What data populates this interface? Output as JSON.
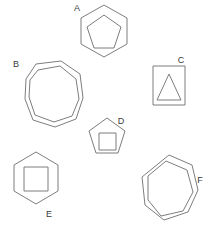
{
  "canvas": {
    "width": 212,
    "height": 232,
    "background": "#ffffff",
    "stroke_color": "#7d7d7d",
    "label_color": "#3a3a3a",
    "stroke_width": 1
  },
  "figure": {
    "type": "geometric-shape-set",
    "shape_count": 6,
    "labels": [
      "A",
      "B",
      "C",
      "D",
      "E",
      "F"
    ]
  },
  "shapes": [
    {
      "id": "A",
      "label": "A",
      "label_position": "top-left",
      "label_x": 77,
      "label_y": 9,
      "description": "hexagon containing a pentagon",
      "outer": {
        "name": "hexagon",
        "sides": 6,
        "points": "104,5 127,18 127,44 104,57 81,44 81,18"
      },
      "inner": {
        "name": "pentagon",
        "sides": 5,
        "points": "104,15 121,27 114,48 94,48 87,27"
      }
    },
    {
      "id": "B",
      "label": "B",
      "label_position": "top-left",
      "label_x": 16,
      "label_y": 65,
      "description": "octagon containing a smaller rotated octagon",
      "outer": {
        "name": "octagon",
        "sides": 8,
        "points": "36,64 61,61 80,74 83,98 76,119 55,127 33,120 25,99 26,79"
      },
      "inner": {
        "name": "octagon",
        "sides": 8,
        "points": "38,70 60,66 76,79 79,99 72,116 54,122 35,115 29,97 30,80"
      }
    },
    {
      "id": "C",
      "label": "C",
      "label_position": "top-right",
      "label_x": 181,
      "label_y": 61,
      "description": "square containing a triangle",
      "outer": {
        "name": "square",
        "sides": 4,
        "points": "153,66 185,66 185,105 153,105"
      },
      "inner": {
        "name": "triangle",
        "sides": 3,
        "points": "169,74 181,100 157,100"
      }
    },
    {
      "id": "D",
      "label": "D",
      "label_position": "top-right",
      "label_x": 121,
      "label_y": 122,
      "description": "pentagon containing a square",
      "outer": {
        "name": "pentagon",
        "sides": 5,
        "points": "107,118 125,131 118,153 96,153 89,131"
      },
      "inner": {
        "name": "square",
        "sides": 4,
        "points": "99,133 116,133 116,150 99,150"
      }
    },
    {
      "id": "E",
      "label": "E",
      "label_position": "bottom-right",
      "label_x": 49,
      "label_y": 215,
      "description": "hexagon containing a square",
      "outer": {
        "name": "hexagon",
        "sides": 6,
        "points": "36,152 58,165 58,191 36,204 14,191 14,165"
      },
      "inner": {
        "name": "square",
        "sides": 4,
        "points": "24,167 48,167 48,191 24,191"
      }
    },
    {
      "id": "F",
      "label": "F",
      "label_position": "right",
      "label_x": 200,
      "label_y": 181,
      "description": "heptagon containing a smaller rotated heptagon",
      "outer": {
        "name": "heptagon",
        "sides": 7,
        "points": "169,155 192,165 198,190 188,212 164,220 145,205 142,177"
      },
      "inner": {
        "name": "heptagon",
        "sides": 7,
        "points": "166,161 187,170 193,192 183,211 161,216 148,200 148,176"
      }
    }
  ]
}
